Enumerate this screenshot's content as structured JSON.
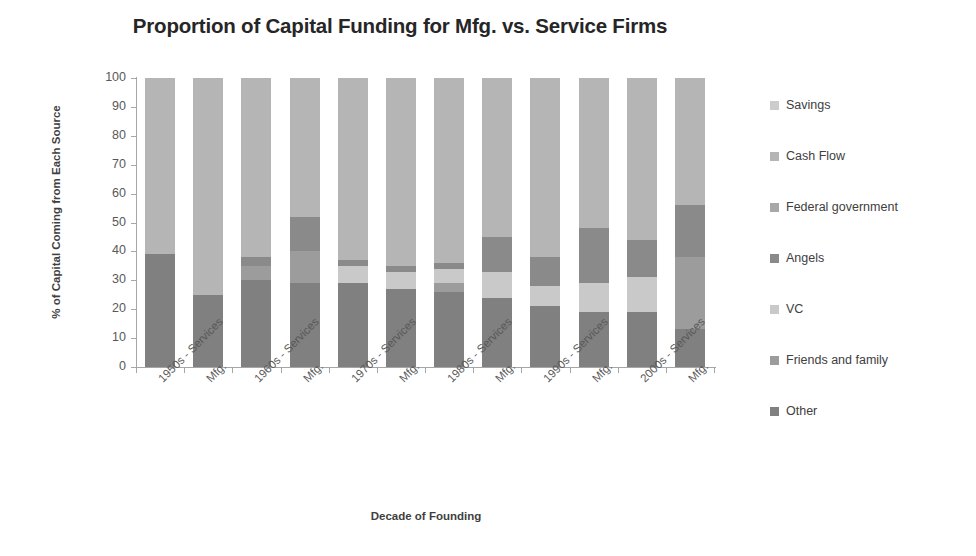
{
  "chart_data": {
    "type": "bar",
    "subtype": "stacked-100-percent",
    "title": "Proportion of Capital Funding for Mfg. vs. Service Firms",
    "xlabel": "Decade of Founding",
    "ylabel": "% of Capital Coming from Each Source",
    "ylim": [
      0,
      100
    ],
    "ytick_step": 10,
    "yticks": [
      100,
      90,
      80,
      70,
      60,
      50,
      40,
      30,
      20,
      10,
      0
    ],
    "grid": false,
    "legend_position": "right",
    "categories": [
      "1950s - Services",
      "Mfg.",
      "1960s - Services",
      "Mfg.",
      "1970s - Services",
      "Mfg.",
      "1980s - Services",
      "Mfg.",
      "1990s - Services",
      "Mfg.",
      "2000s - Services",
      "Mfg."
    ],
    "series": [
      {
        "name": "Other",
        "color": "#808080",
        "values": [
          39,
          25,
          30,
          29,
          29,
          27,
          26,
          24,
          21,
          19,
          19,
          13
        ]
      },
      {
        "name": "Friends and family",
        "color": "#9c9c9c",
        "values": [
          0,
          0,
          5,
          11,
          0,
          0,
          3,
          0,
          0,
          0,
          0,
          25
        ]
      },
      {
        "name": "VC",
        "color": "#c9c9c9",
        "values": [
          0,
          0,
          0,
          0,
          6,
          6,
          5,
          9,
          7,
          10,
          12,
          0
        ]
      },
      {
        "name": "Angels",
        "color": "#8a8a8a",
        "values": [
          0,
          0,
          3,
          12,
          2,
          2,
          2,
          12,
          10,
          19,
          13,
          18
        ]
      },
      {
        "name": "Federal government",
        "color": "#a8a8a8",
        "values": [
          0,
          0,
          0,
          0,
          0,
          0,
          0,
          0,
          0,
          0,
          0,
          0
        ]
      },
      {
        "name": "Cash Flow",
        "color": "#b5b5b5",
        "values": [
          61,
          75,
          62,
          48,
          63,
          65,
          64,
          55,
          62,
          52,
          56,
          44
        ]
      },
      {
        "name": "Savings",
        "color": "#cccccc",
        "values": [
          0,
          0,
          0,
          0,
          0,
          0,
          0,
          0,
          0,
          0,
          0,
          0
        ]
      }
    ],
    "legend_entries": [
      {
        "label": "Savings",
        "color": "#cccccc"
      },
      {
        "label": "Cash Flow",
        "color": "#b5b5b5"
      },
      {
        "label": "Federal government",
        "color": "#a8a8a8"
      },
      {
        "label": "Angels",
        "color": "#8a8a8a"
      },
      {
        "label": "VC",
        "color": "#c9c9c9"
      },
      {
        "label": "Friends and family",
        "color": "#9c9c9c"
      },
      {
        "label": "Other",
        "color": "#808080"
      }
    ],
    "stack_order_bottom_to_top": [
      "Other",
      "Friends and family",
      "VC",
      "Angels",
      "Federal government",
      "Cash Flow",
      "Savings"
    ]
  },
  "colors": {
    "axis": "#a6a6a6",
    "tick_text": "#595959",
    "title_text": "#262626",
    "background": "#ffffff"
  }
}
